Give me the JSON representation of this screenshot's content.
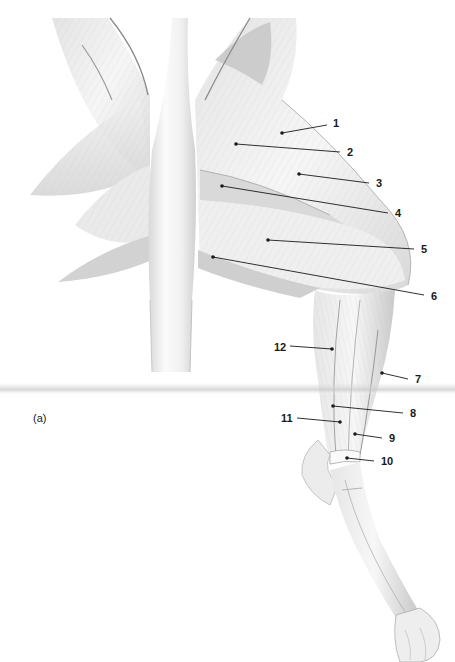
{
  "figure": {
    "panel_letter": "(a)",
    "line_color": "#1a1a1a",
    "fold_band_color": "#cfcfcf"
  },
  "callouts": [
    {
      "id": "1",
      "label": "1",
      "anchor": [
        282,
        133
      ],
      "text_pos": [
        333,
        118
      ],
      "line_end": [
        327,
        125
      ]
    },
    {
      "id": "2",
      "label": "2",
      "anchor": [
        236,
        144
      ],
      "text_pos": [
        347,
        147
      ],
      "line_end": [
        340,
        152
      ]
    },
    {
      "id": "3",
      "label": "3",
      "anchor": [
        299,
        174
      ],
      "text_pos": [
        376,
        178
      ],
      "line_end": [
        369,
        183
      ]
    },
    {
      "id": "4",
      "label": "4",
      "anchor": [
        222,
        186
      ],
      "text_pos": [
        395,
        208
      ],
      "line_end": [
        388,
        213
      ]
    },
    {
      "id": "5",
      "label": "5",
      "anchor": [
        268,
        240
      ],
      "text_pos": [
        421,
        244
      ],
      "line_end": [
        414,
        249
      ]
    },
    {
      "id": "6",
      "label": "6",
      "anchor": [
        213,
        257
      ],
      "text_pos": [
        431,
        291
      ],
      "line_end": [
        424,
        295
      ]
    },
    {
      "id": "7",
      "label": "7",
      "anchor": [
        382,
        373
      ],
      "text_pos": [
        415,
        374
      ],
      "line_end": [
        408,
        379
      ]
    },
    {
      "id": "8",
      "label": "8",
      "anchor": [
        333,
        406
      ],
      "text_pos": [
        410,
        408
      ],
      "line_end": [
        403,
        413
      ]
    },
    {
      "id": "9",
      "label": "9",
      "anchor": [
        355,
        434
      ],
      "text_pos": [
        389,
        433
      ],
      "line_end": [
        382,
        438
      ]
    },
    {
      "id": "10",
      "label": "10",
      "anchor": [
        347,
        458
      ],
      "text_pos": [
        381,
        456
      ],
      "line_end": [
        374,
        461
      ]
    },
    {
      "id": "11",
      "label": "11",
      "anchor": [
        340,
        422
      ],
      "text_pos": [
        281,
        413
      ],
      "line_end": [
        297,
        418
      ]
    },
    {
      "id": "12",
      "label": "12",
      "anchor": [
        332,
        349
      ],
      "text_pos": [
        274,
        342
      ],
      "line_end": [
        290,
        346
      ]
    }
  ]
}
